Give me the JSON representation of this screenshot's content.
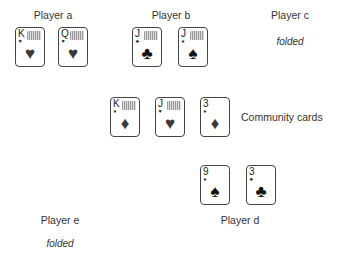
{
  "players": {
    "a": {
      "label": "Player a",
      "cards": [
        {
          "rank": "K",
          "suit": "♥",
          "face": true,
          "color": "red"
        },
        {
          "rank": "Q",
          "suit": "♥",
          "face": true,
          "color": "red"
        }
      ]
    },
    "b": {
      "label": "Player b",
      "cards": [
        {
          "rank": "J",
          "suit": "♣",
          "face": true,
          "color": "black"
        },
        {
          "rank": "J",
          "suit": "♠",
          "face": true,
          "color": "black"
        }
      ]
    },
    "c": {
      "label": "Player c",
      "status": "folded"
    },
    "d": {
      "label": "Player d",
      "cards": [
        {
          "rank": "9",
          "suit": "♠",
          "face": false,
          "color": "black"
        },
        {
          "rank": "3",
          "suit": "♣",
          "face": false,
          "color": "black"
        }
      ]
    },
    "e": {
      "label": "Player e",
      "status": "folded"
    }
  },
  "community": {
    "label": "Community cards",
    "cards": [
      {
        "rank": "K",
        "suit": "♦",
        "face": true,
        "color": "red"
      },
      {
        "rank": "J",
        "suit": "♥",
        "face": true,
        "color": "red"
      },
      {
        "rank": "3",
        "suit": "♦",
        "face": false,
        "color": "red"
      }
    ]
  },
  "colors": {
    "red_suit": "#3a3a3a",
    "black_suit": "#111111",
    "card_border": "#444444"
  }
}
